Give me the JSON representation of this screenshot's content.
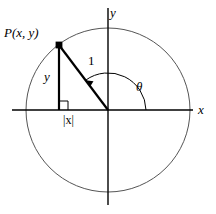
{
  "figure": {
    "background_color": "#ffffff",
    "stroke_color": "#000000",
    "circle_stroke_color": "#555555",
    "labels": {
      "point": "P(x, y)",
      "y_axis": "y",
      "x_axis": "x",
      "radius": "1",
      "opposite_side": "y",
      "adjacent_side": "|x|",
      "angle": "θ"
    },
    "geometry": {
      "origin_x": 108,
      "origin_y": 110,
      "circle_radius": 82,
      "point_x": 59,
      "point_y": 45,
      "x_axis_start": 12,
      "x_axis_end": 193,
      "y_axis_start": 8,
      "y_axis_end": 205,
      "angle_arc_radius": 38,
      "right_angle_marker_size": 9
    }
  }
}
